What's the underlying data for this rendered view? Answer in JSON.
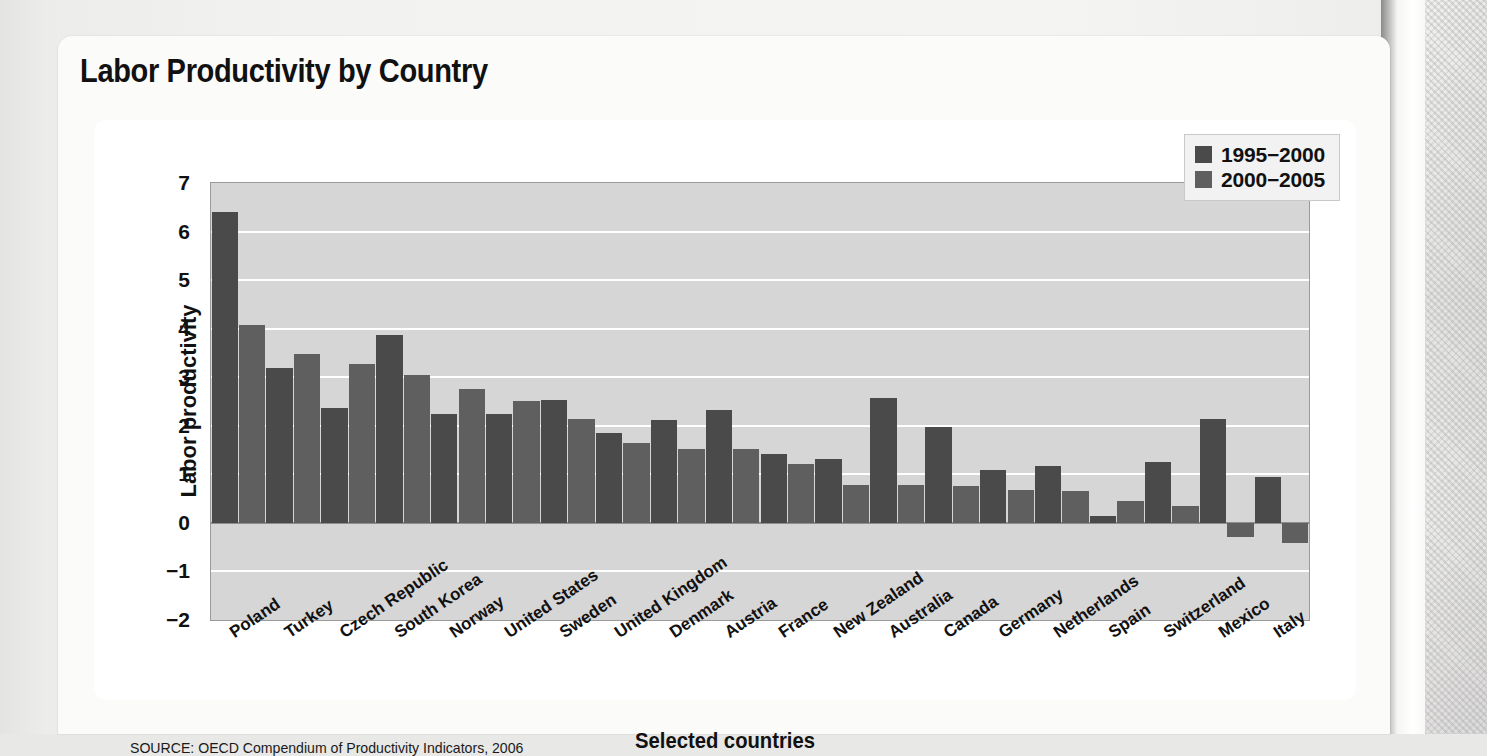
{
  "figure": {
    "title": "Labor Productivity by Country",
    "source_note": "SOURCE: OECD Compendium of Productivity Indicators, 2006"
  },
  "chart_data": {
    "type": "bar",
    "title": "Labor Productivity by Country",
    "xlabel": "Selected countries",
    "ylabel": "Labor productivity",
    "ylim": [
      -2,
      7
    ],
    "yticks": [
      7,
      6,
      5,
      4,
      3,
      2,
      1,
      0,
      -1,
      -2
    ],
    "ytick_labels": [
      "7",
      "6",
      "5",
      "4",
      "3",
      "2",
      "1",
      "0",
      "−1",
      "−2"
    ],
    "grid": true,
    "legend_position": "top-right",
    "categories": [
      "Poland",
      "Turkey",
      "Czech Republic",
      "South Korea",
      "Norway",
      "United States",
      "Sweden",
      "United Kingdom",
      "Denmark",
      "Austria",
      "France",
      "New Zealand",
      "Australia",
      "Canada",
      "Germany",
      "Netherlands",
      "Spain",
      "Switzerland",
      "Mexico",
      "Italy"
    ],
    "series": [
      {
        "name": "1995−2000",
        "color": "#4a4a4a",
        "values": [
          6.4,
          3.2,
          2.37,
          3.86,
          2.25,
          2.24,
          2.53,
          1.85,
          2.12,
          2.32,
          1.42,
          1.32,
          2.57,
          1.97,
          1.08,
          1.17,
          0.15,
          1.25,
          2.13,
          0.95
        ]
      },
      {
        "name": "2000−2005",
        "color": "#5f5f5f",
        "values": [
          4.07,
          3.47,
          3.27,
          3.04,
          2.76,
          2.52,
          2.13,
          1.64,
          1.53,
          1.52,
          1.21,
          0.79,
          0.78,
          0.77,
          0.67,
          0.65,
          0.45,
          0.35,
          -0.3,
          -0.42
        ]
      }
    ],
    "colors": {
      "series_1995_2000": "#4a4a4a",
      "series_2000_2005": "#5f5f5f",
      "plot_background": "#d6d6d6",
      "gridline": "#ffffff",
      "text": "#111111"
    }
  }
}
